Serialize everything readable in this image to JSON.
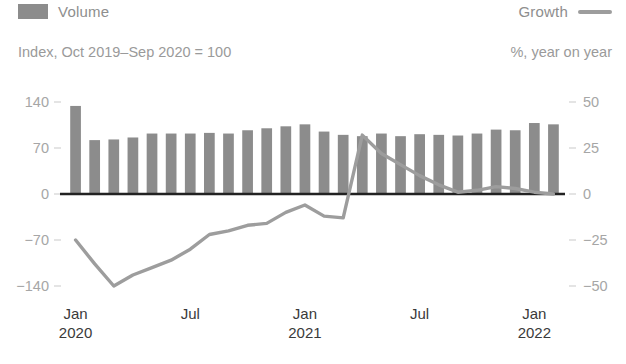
{
  "legend": {
    "volume_label": "Volume",
    "growth_label": "Growth",
    "volume_swatch_color": "#8c8c8c",
    "growth_line_color": "#9d9d9d"
  },
  "units": {
    "left": "Index, Oct 2019–Sep 2020 = 100",
    "right": "%, year on year"
  },
  "chart_data": {
    "type": "bar",
    "title": "",
    "subtitle": "",
    "xlabel": "",
    "ylabel": "Index, Oct 2019–Sep 2020 = 100",
    "y2label": "%, year on year",
    "grid": false,
    "legend_position": "top",
    "ylim": [
      -140,
      140
    ],
    "y2lim": [
      -50,
      50
    ],
    "yticks": [
      140,
      70,
      0,
      -70,
      -140
    ],
    "ytick_labels": [
      "140",
      "70",
      "0",
      "−70",
      "−140"
    ],
    "y2ticks": [
      50,
      25,
      0,
      -25,
      -50
    ],
    "y2tick_labels": [
      "50",
      "25",
      "0",
      "−25",
      "−50"
    ],
    "x": [
      "Jan 2020",
      "Feb 2020",
      "Mar 2020",
      "Apr 2020",
      "May 2020",
      "Jun 2020",
      "Jul 2020",
      "Aug 2020",
      "Sep 2020",
      "Oct 2020",
      "Nov 2020",
      "Dec 2020",
      "Jan 2021",
      "Feb 2021",
      "Mar 2021",
      "Apr 2021",
      "May 2021",
      "Jun 2021",
      "Jul 2021",
      "Aug 2021",
      "Sep 2021",
      "Oct 2021",
      "Nov 2021",
      "Dec 2021",
      "Jan 2022",
      "Feb 2022"
    ],
    "xtick_labels": [
      {
        "month": "Jan",
        "year": "2020",
        "index": 0
      },
      {
        "month": "Jul",
        "year": "",
        "index": 6
      },
      {
        "month": "Jan",
        "year": "2021",
        "index": 12
      },
      {
        "month": "Jul",
        "year": "",
        "index": 18
      },
      {
        "month": "Jan",
        "year": "2022",
        "index": 24
      }
    ],
    "series": [
      {
        "name": "Volume",
        "type": "bar",
        "axis": "left",
        "color": "#8c8c8c",
        "values": [
          134,
          82,
          83,
          86,
          92,
          92,
          92,
          93,
          92,
          97,
          100,
          103,
          106,
          95,
          90,
          88,
          92,
          88,
          91,
          90,
          89,
          92,
          98,
          97,
          108,
          106
        ]
      },
      {
        "name": "Growth",
        "type": "line",
        "axis": "right",
        "color": "#9d9d9d",
        "values": [
          -25,
          -38,
          -50,
          -44,
          -40,
          -36,
          -30,
          -22,
          -20,
          -17,
          -16,
          -10,
          -6,
          -12,
          -13,
          32,
          22,
          16,
          10,
          5,
          1,
          2,
          4,
          3,
          1,
          0
        ]
      }
    ]
  },
  "xaxis_display": [
    {
      "month": "Jan",
      "year": "2020"
    },
    {
      "month": "Jul",
      "year": ""
    },
    {
      "month": "Jan",
      "year": "2021"
    },
    {
      "month": "Jul",
      "year": ""
    },
    {
      "month": "Jan",
      "year": "2022"
    }
  ]
}
